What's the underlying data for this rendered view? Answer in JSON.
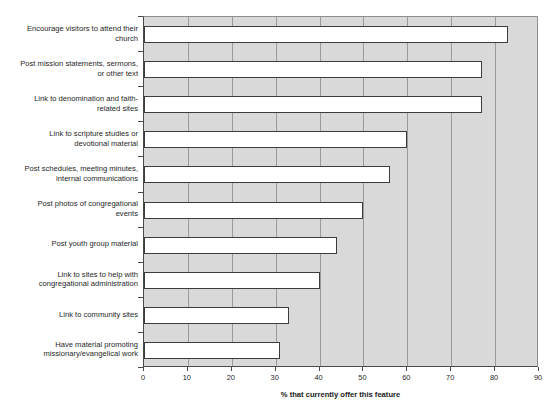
{
  "chart_data": {
    "type": "bar",
    "orientation": "horizontal",
    "title": "",
    "xlabel": "% that currently offer this feature",
    "ylabel": "",
    "xlim": [
      0,
      90
    ],
    "xticks": [
      0,
      10,
      20,
      30,
      40,
      50,
      60,
      70,
      80,
      90
    ],
    "grid": true,
    "legend": false,
    "categories": [
      "Encourage visitors to attend their church",
      "Post mission statements, sermons, or other text",
      "Link to denomination and faith-related sites",
      "Link to scripture studies or devotional material",
      "Post schedules, meeting minutes, internal communications",
      "Post photos of congregational events",
      "Post youth group material",
      "Link to sites to help with congregational administration",
      "Link to community sites",
      "Have material promoting missionary/evangelical work"
    ],
    "values": [
      83,
      77,
      77,
      60,
      56,
      50,
      44,
      40,
      33,
      31
    ],
    "colors": {
      "bar_fill": "#ffffff",
      "bar_border": "#3c3c3c",
      "plot_background": "#d9d9d9",
      "gridline": "#9a9a9a",
      "axis": "#4a4a4a"
    }
  },
  "axis": {
    "x_title": "% that currently offer this feature",
    "tick_labels": [
      "0",
      "10",
      "20",
      "30",
      "40",
      "50",
      "60",
      "70",
      "80",
      "90"
    ]
  },
  "categories_display": [
    [
      "Encourage visitors to attend their",
      "church"
    ],
    [
      "Post mission statements, sermons,",
      "or other text"
    ],
    [
      "Link to denomination and faith-",
      "related sites"
    ],
    [
      "Link to scripture studies or",
      "devotional material"
    ],
    [
      "Post schedules, meeting minutes,",
      "internal communications"
    ],
    [
      "Post photos of congregational",
      "events"
    ],
    [
      "Post youth group material"
    ],
    [
      "Link to sites to help with",
      "congregational administration"
    ],
    [
      "Link to community sites"
    ],
    [
      "Have material promoting",
      "missionary/evangelical work"
    ]
  ]
}
